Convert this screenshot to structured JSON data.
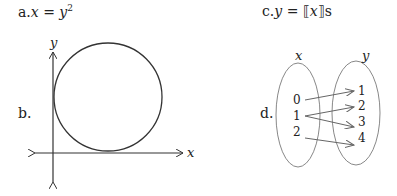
{
  "items": {
    "a": {
      "prefix": "a.",
      "var_left": "x",
      "equals": " = ",
      "var_right": "y",
      "exponent": "2"
    },
    "b": {
      "prefix": "b.",
      "x_axis_label": "x",
      "y_axis_label": "y",
      "shape": "circle tangent to both axes"
    },
    "c": {
      "prefix": "c.",
      "var_left": "y",
      "equals": " = ",
      "bracket_open": "⟦",
      "var_inner": "x",
      "bracket_close": "⟧",
      "suffix": "s"
    },
    "d": {
      "prefix": "d.",
      "domain_label": "x",
      "range_label": "y",
      "domain": [
        "0",
        "1",
        "2"
      ],
      "range": [
        "1",
        "2",
        "3",
        "4"
      ],
      "mappings": [
        {
          "from": "0",
          "to": "1"
        },
        {
          "from": "1",
          "to": "2"
        },
        {
          "from": "1",
          "to": "3"
        },
        {
          "from": "2",
          "to": "4"
        }
      ]
    }
  },
  "colors": {
    "ink": "#222222",
    "ellipse": "#888888",
    "arrow": "#666666"
  }
}
